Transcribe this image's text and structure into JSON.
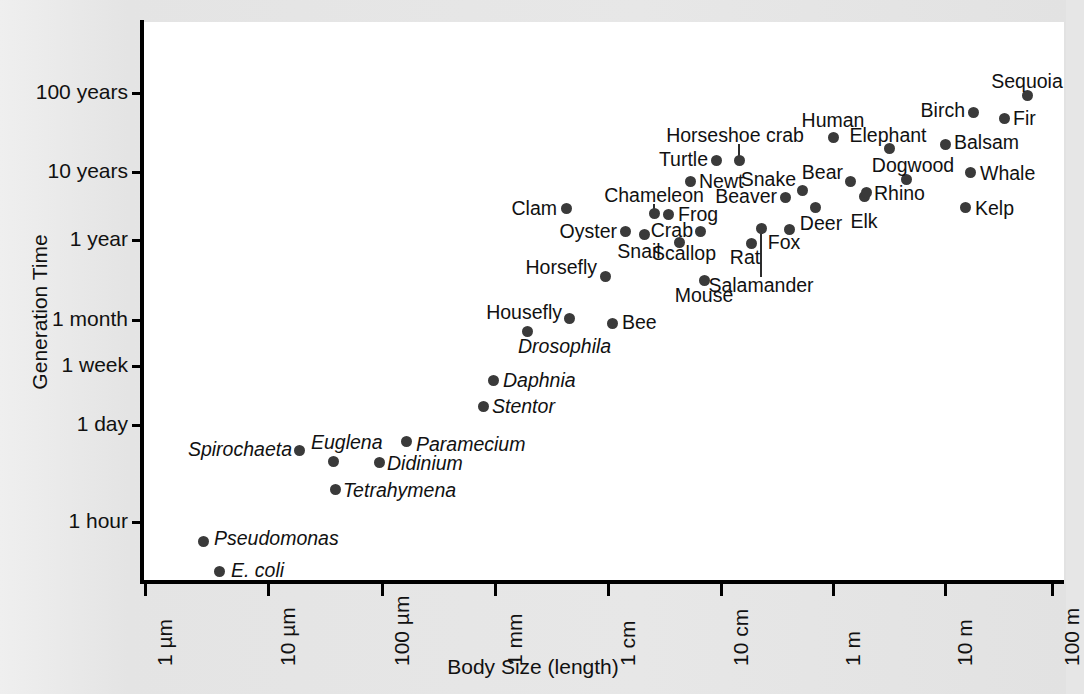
{
  "chart_data": {
    "type": "scatter",
    "title": "",
    "xlabel": "Body Size (length)",
    "ylabel": "Generation Time",
    "grid": false,
    "legend": "none",
    "xscale": "log",
    "yscale": "log",
    "xlim": [
      "1 µm",
      "100 m"
    ],
    "ylim": [
      "~20 minutes",
      "~150 years"
    ],
    "x_tick_labels": [
      "1 µm",
      "10 µm",
      "100 µm",
      "1 mm",
      "1 cm",
      "10 cm",
      "1 m",
      "10 m",
      "100 m"
    ],
    "y_tick_labels": [
      "100 years",
      "10 years",
      "1 year",
      "1 month",
      "1 week",
      "1 day",
      "1 hour"
    ],
    "point_color": "#3a3a3a",
    "points": [
      {
        "name": "E. coli",
        "italic": true,
        "x_size": "3 µm",
        "y_time": "20 minutes"
      },
      {
        "name": "Pseudomonas",
        "italic": true,
        "x_size": "2 µm",
        "y_time": "40 minutes"
      },
      {
        "name": "Spirochaeta",
        "italic": true,
        "x_size": "7 µm",
        "y_time": "8 hours"
      },
      {
        "name": "Euglena",
        "italic": true,
        "x_size": "13 µm",
        "y_time": "6 hours"
      },
      {
        "name": "Didinium",
        "italic": true,
        "x_size": "35 µm",
        "y_time": "5 hours"
      },
      {
        "name": "Tetrahymena",
        "italic": true,
        "x_size": "30 µm",
        "y_time": "2.5 hours"
      },
      {
        "name": "Paramecium",
        "italic": true,
        "x_size": "150 µm",
        "y_time": "10 hours"
      },
      {
        "name": "Stentor",
        "italic": true,
        "x_size": "1 mm",
        "y_time": "18 hours"
      },
      {
        "name": "Daphnia",
        "italic": true,
        "x_size": "1.5 mm",
        "y_time": "5 days"
      },
      {
        "name": "Drosophila",
        "italic": true,
        "x_size": "2.5 mm",
        "y_time": "18 days"
      },
      {
        "name": "Housefly",
        "italic": false,
        "x_size": "6 mm",
        "y_time": "1 month"
      },
      {
        "name": "Bee",
        "italic": false,
        "x_size": "1.2 cm",
        "y_time": "1 month"
      },
      {
        "name": "Horsefly",
        "italic": false,
        "x_size": "1 cm",
        "y_time": "4 months"
      },
      {
        "name": "Mouse",
        "italic": false,
        "x_size": "6 cm",
        "y_time": "5 months"
      },
      {
        "name": "Clam",
        "italic": false,
        "x_size": "7 cm",
        "y_time": "3 years"
      },
      {
        "name": "Oyster",
        "italic": false,
        "x_size": "8 cm",
        "y_time": "1.3 years"
      },
      {
        "name": "Snail",
        "italic": false,
        "x_size": "3 cm",
        "y_time": "1.3 years"
      },
      {
        "name": "Scallop",
        "italic": false,
        "x_size": "5 cm",
        "y_time": "1 year"
      },
      {
        "name": "Chameleon",
        "italic": false,
        "x_size": "20 cm",
        "y_time": "2.5 years",
        "leader": true
      },
      {
        "name": "Frog",
        "italic": false,
        "x_size": "8 cm",
        "y_time": "3 years"
      },
      {
        "name": "Crab",
        "italic": false,
        "x_size": "12 cm",
        "y_time": "1.3 years"
      },
      {
        "name": "Rat",
        "italic": false,
        "x_size": "20 cm",
        "y_time": "1 year"
      },
      {
        "name": "Salamander",
        "italic": false,
        "x_size": "25 cm",
        "y_time": "2 years",
        "leader": true
      },
      {
        "name": "Turtle",
        "italic": false,
        "x_size": "30 cm",
        "y_time": "8 years"
      },
      {
        "name": "Newt",
        "italic": false,
        "x_size": "15 cm",
        "y_time": "5 years"
      },
      {
        "name": "Horseshoe crab",
        "italic": false,
        "x_size": "50 cm",
        "y_time": "12 years",
        "leader": true
      },
      {
        "name": "Beaver",
        "italic": false,
        "x_size": "80 cm",
        "y_time": "3 years"
      },
      {
        "name": "Snake",
        "italic": false,
        "x_size": "1.2 m",
        "y_time": "4 years"
      },
      {
        "name": "Fox",
        "italic": false,
        "x_size": "80 cm",
        "y_time": "2 years"
      },
      {
        "name": "Deer",
        "italic": false,
        "x_size": "1.5 m",
        "y_time": "3 years"
      },
      {
        "name": "Elk",
        "italic": false,
        "x_size": "2.2 m",
        "y_time": "4 years"
      },
      {
        "name": "Bear",
        "italic": false,
        "x_size": "2 m",
        "y_time": "6 years"
      },
      {
        "name": "Human",
        "italic": false,
        "x_size": "1.7 m",
        "y_time": "30 years"
      },
      {
        "name": "Rhino",
        "italic": false,
        "x_size": "3.5 m",
        "y_time": "8 years"
      },
      {
        "name": "Elephant",
        "italic": false,
        "x_size": "5 m",
        "y_time": "20 years"
      },
      {
        "name": "Dogwood",
        "italic": false,
        "x_size": "8 m",
        "y_time": "8 years"
      },
      {
        "name": "Kelp",
        "italic": false,
        "x_size": "15 m",
        "y_time": "3 years"
      },
      {
        "name": "Whale",
        "italic": false,
        "x_size": "25 m",
        "y_time": "10 years"
      },
      {
        "name": "Balsam",
        "italic": false,
        "x_size": "18 m",
        "y_time": "20 years"
      },
      {
        "name": "Birch",
        "italic": false,
        "x_size": "20 m",
        "y_time": "40 years"
      },
      {
        "name": "Fir",
        "italic": false,
        "x_size": "40 m",
        "y_time": "40 years"
      },
      {
        "name": "Sequoia",
        "italic": false,
        "x_size": "70 m",
        "y_time": "100 years"
      }
    ]
  },
  "axes": {
    "y_title": "Generation Time",
    "x_title": "Body Size (length)",
    "y_ticks": [
      {
        "label": "100 years",
        "py": 93
      },
      {
        "label": "10 years",
        "py": 172
      },
      {
        "label": "1 year",
        "py": 240
      },
      {
        "label": "1 month",
        "py": 320
      },
      {
        "label": "1 week",
        "py": 366
      },
      {
        "label": "1 day",
        "py": 425
      },
      {
        "label": "1 hour",
        "py": 522
      }
    ],
    "x_ticks": [
      {
        "label": "1 µm",
        "px": 145
      },
      {
        "label": "10 µm",
        "px": 268
      },
      {
        "label": "100 µm",
        "px": 382
      },
      {
        "label": "1 mm",
        "px": 495
      },
      {
        "label": "1 cm",
        "px": 608
      },
      {
        "label": "10 cm",
        "px": 721
      },
      {
        "label": "1 m",
        "px": 833
      },
      {
        "label": "10 m",
        "px": 945
      },
      {
        "label": "100 m",
        "px": 1052
      }
    ]
  },
  "plot_points": [
    {
      "name": "E. coli",
      "px": 219,
      "py": 571,
      "italic": true,
      "lx": 231,
      "ly": 571,
      "anchor": "l"
    },
    {
      "name": "Pseudomonas",
      "px": 203,
      "py": 541,
      "italic": true,
      "lx": 214,
      "ly": 539,
      "anchor": "l"
    },
    {
      "name": "Spirochaeta",
      "px": 299,
      "py": 450,
      "italic": true,
      "lx": 292,
      "ly": 450,
      "anchor": "r"
    },
    {
      "name": "Euglena",
      "px": 333,
      "py": 461,
      "italic": true,
      "lx": 311,
      "ly": 443,
      "anchor": "l"
    },
    {
      "name": "Didinium",
      "px": 379,
      "py": 462,
      "italic": true,
      "lx": 387,
      "ly": 464,
      "anchor": "l"
    },
    {
      "name": "Tetrahymena",
      "px": 335,
      "py": 489,
      "italic": true,
      "lx": 343,
      "ly": 491,
      "anchor": "l"
    },
    {
      "name": "Paramecium",
      "px": 406,
      "py": 441,
      "italic": true,
      "lx": 416,
      "ly": 445,
      "anchor": "l"
    },
    {
      "name": "Stentor",
      "px": 483,
      "py": 406,
      "italic": true,
      "lx": 492,
      "ly": 407,
      "anchor": "l"
    },
    {
      "name": "Daphnia",
      "px": 493,
      "py": 380,
      "italic": true,
      "lx": 503,
      "ly": 381,
      "anchor": "l"
    },
    {
      "name": "Drosophila",
      "px": 527,
      "py": 331,
      "italic": true,
      "lx": 518,
      "ly": 347,
      "anchor": "l"
    },
    {
      "name": "Housefly",
      "px": 569,
      "py": 318,
      "italic": false,
      "lx": 562,
      "ly": 313,
      "anchor": "r"
    },
    {
      "name": "Bee",
      "px": 612,
      "py": 323,
      "italic": false,
      "lx": 622,
      "ly": 323,
      "anchor": "l"
    },
    {
      "name": "Horsefly",
      "px": 605,
      "py": 276,
      "italic": false,
      "lx": 597,
      "ly": 268,
      "anchor": "r"
    },
    {
      "name": "Mouse",
      "px": 704,
      "py": 280,
      "italic": false,
      "lx": 704,
      "ly": 296,
      "anchor": "c"
    },
    {
      "name": "Clam",
      "px": 566,
      "py": 208,
      "italic": false,
      "lx": 557,
      "ly": 209,
      "anchor": "r"
    },
    {
      "name": "Oyster",
      "px": 625,
      "py": 231,
      "italic": false,
      "lx": 617,
      "ly": 232,
      "anchor": "r"
    },
    {
      "name": "Snail",
      "px": 644,
      "py": 234,
      "italic": false,
      "lx": 639,
      "ly": 252,
      "anchor": "c"
    },
    {
      "name": "Scallop",
      "px": 679,
      "py": 242,
      "italic": false,
      "lx": 684,
      "ly": 254,
      "anchor": "c"
    },
    {
      "name": "Chameleon",
      "px": 654,
      "py": 213,
      "italic": false,
      "lx": 654,
      "ly": 196,
      "anchor": "c"
    },
    {
      "name": "Frog",
      "px": 668,
      "py": 214,
      "italic": false,
      "lx": 678,
      "ly": 215,
      "anchor": "l"
    },
    {
      "name": "Crab",
      "px": 700,
      "py": 231,
      "italic": false,
      "lx": 693,
      "ly": 231,
      "anchor": "r"
    },
    {
      "name": "Rat",
      "px": 751,
      "py": 243,
      "italic": false,
      "lx": 745,
      "ly": 258,
      "anchor": "c"
    },
    {
      "name": "Salamander",
      "px": 761,
      "py": 228,
      "italic": false,
      "lx": 761,
      "ly": 286,
      "anchor": "c"
    },
    {
      "name": "Turtle",
      "px": 716,
      "py": 160,
      "italic": false,
      "lx": 708,
      "ly": 160,
      "anchor": "r"
    },
    {
      "name": "Newt",
      "px": 690,
      "py": 181,
      "italic": false,
      "lx": 699,
      "ly": 182,
      "anchor": "l"
    },
    {
      "name": "Horseshoe crab",
      "px": 739,
      "py": 160,
      "italic": false,
      "lx": 735,
      "ly": 136,
      "anchor": "c"
    },
    {
      "name": "Beaver",
      "px": 785,
      "py": 197,
      "italic": false,
      "lx": 777,
      "ly": 197,
      "anchor": "r"
    },
    {
      "name": "Snake",
      "px": 802,
      "py": 190,
      "italic": false,
      "lx": 796,
      "ly": 180,
      "anchor": "r"
    },
    {
      "name": "Fox",
      "px": 789,
      "py": 229,
      "italic": false,
      "lx": 784,
      "ly": 243,
      "anchor": "c"
    },
    {
      "name": "Deer",
      "px": 815,
      "py": 207,
      "italic": false,
      "lx": 821,
      "ly": 224,
      "anchor": "c"
    },
    {
      "name": "Elk",
      "px": 864,
      "py": 196,
      "italic": false,
      "lx": 864,
      "ly": 222,
      "anchor": "c"
    },
    {
      "name": "Bear",
      "px": 850,
      "py": 181,
      "italic": false,
      "lx": 843,
      "ly": 173,
      "anchor": "r"
    },
    {
      "name": "Human",
      "px": 833,
      "py": 137,
      "italic": false,
      "lx": 833,
      "ly": 121,
      "anchor": "c"
    },
    {
      "name": "Rhino",
      "px": 866,
      "py": 192,
      "italic": false,
      "lx": 874,
      "ly": 194,
      "anchor": "l"
    },
    {
      "name": "Elephant",
      "px": 889,
      "py": 148,
      "italic": false,
      "lx": 888,
      "ly": 136,
      "anchor": "c"
    },
    {
      "name": "Dogwood",
      "px": 906,
      "py": 179,
      "italic": false,
      "lx": 913,
      "ly": 166,
      "anchor": "c"
    },
    {
      "name": "Kelp",
      "px": 965,
      "py": 207,
      "italic": false,
      "lx": 975,
      "ly": 209,
      "anchor": "l"
    },
    {
      "name": "Whale",
      "px": 970,
      "py": 172,
      "italic": false,
      "lx": 980,
      "ly": 174,
      "anchor": "l"
    },
    {
      "name": "Balsam",
      "px": 945,
      "py": 144,
      "italic": false,
      "lx": 954,
      "ly": 143,
      "anchor": "l"
    },
    {
      "name": "Birch",
      "px": 973,
      "py": 112,
      "italic": false,
      "lx": 965,
      "ly": 111,
      "anchor": "r"
    },
    {
      "name": "Fir",
      "px": 1004,
      "py": 118,
      "italic": false,
      "lx": 1013,
      "ly": 119,
      "anchor": "l"
    },
    {
      "name": "Sequoia",
      "px": 1027,
      "py": 95,
      "italic": false,
      "lx": 1027,
      "ly": 82,
      "anchor": "c"
    }
  ],
  "leaders": [
    {
      "name": "chameleon-leader",
      "px": 654,
      "py_top": 204,
      "py_bot": 213
    },
    {
      "name": "horseshoe-crab-leader",
      "px": 739,
      "py_top": 144,
      "py_bot": 160
    },
    {
      "name": "salamander-leader",
      "px": 761,
      "py_top": 228,
      "py_bot": 277
    }
  ]
}
